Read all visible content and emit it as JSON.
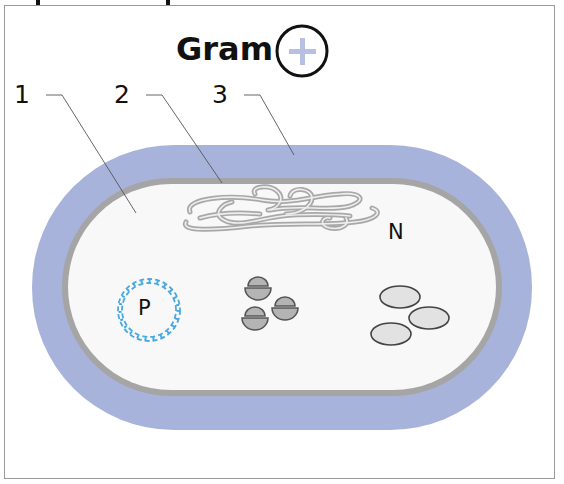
{
  "title": {
    "text": "Gram",
    "sign_icon": "plus-in-circle-icon",
    "sign_meaning": "positive"
  },
  "callouts": [
    {
      "number": "1",
      "points_to": "cytoplasm"
    },
    {
      "number": "2",
      "points_to": "cell-membrane"
    },
    {
      "number": "3",
      "points_to": "cell-wall"
    }
  ],
  "inner_labels": {
    "nucleoid": "N",
    "plasmid": "P"
  },
  "colors": {
    "cell_wall": "#a7b3da",
    "cell_membrane": "#a5a5a5",
    "cytoplasm": "#f8f8f8",
    "nucleoid_strand": "#b8b8b8",
    "plasmid_helix": "#4aa8e0",
    "ribosome_fill": "#b4b4b4",
    "inclusion_fill": "#e2e2e2",
    "plus_sign": "#b7c0e2",
    "frame": "#9a9a9a"
  },
  "components": {
    "ribosomes_count": 3,
    "inclusion_bodies_count": 3
  }
}
